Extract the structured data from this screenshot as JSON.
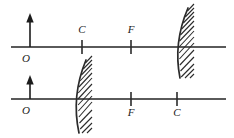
{
  "figure": {
    "width": 234,
    "height": 138,
    "background_color": "#ffffff",
    "line_color": "#2b2b2b",
    "axis_color": "#5a5a5a"
  },
  "diagrams": [
    {
      "id": "upper-diagram",
      "axis": {
        "y": 47,
        "x_start": 11,
        "x_end": 226
      },
      "object": {
        "label": "O",
        "label_x": 26,
        "label_y": 62,
        "arrow_x": 30,
        "arrow_base_y": 47,
        "arrow_tip_y": 14
      },
      "markers": [
        {
          "label": "C",
          "x": 82,
          "label_x": 78,
          "label_y": 33
        },
        {
          "label": "F",
          "x": 131,
          "label_x": 127,
          "label_y": 33
        }
      ],
      "mirror": {
        "type": "concave-mirror",
        "vertex_x": 182,
        "top_y": 8,
        "bottom_y": 78,
        "bulge": -9,
        "hatch_side": "right"
      }
    },
    {
      "id": "lower-diagram",
      "axis": {
        "y": 99,
        "x_start": 11,
        "x_end": 226
      },
      "object": {
        "label": "O",
        "label_x": 26,
        "label_y": 114,
        "arrow_x": 30,
        "arrow_base_y": 99,
        "arrow_tip_y": 76
      },
      "markers": [
        {
          "label": "F",
          "x": 131,
          "label_x": 127,
          "label_y": 114
        },
        {
          "label": "C",
          "x": 177,
          "label_x": 173,
          "label_y": 114
        }
      ],
      "mirror": {
        "type": "concave-mirror",
        "vertex_x": 80,
        "top_y": 60,
        "bottom_y": 133,
        "bulge": -9,
        "hatch_side": "right"
      }
    }
  ]
}
